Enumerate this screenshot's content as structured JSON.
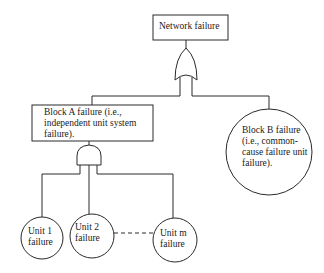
{
  "top_event": {
    "label": "Network failure"
  },
  "top_gate": {
    "type": "OR"
  },
  "block_a": {
    "line1": "Block A failure (i.e.,",
    "line2": "independent unit system",
    "line3": "failure)."
  },
  "block_a_gate": {
    "type": "AND"
  },
  "block_b": {
    "line1": "Block B failure",
    "line2": "(i.e., common-",
    "line3": "cause failure unit",
    "line4": "failure)."
  },
  "units": [
    {
      "line1": "Unit 1",
      "line2": "failure"
    },
    {
      "line1": "Unit 2",
      "line2": "failure"
    },
    {
      "line1": "Unit m",
      "line2": "failure"
    }
  ],
  "colors": {
    "line": "#2a2a2a",
    "background": "#ffffff"
  }
}
